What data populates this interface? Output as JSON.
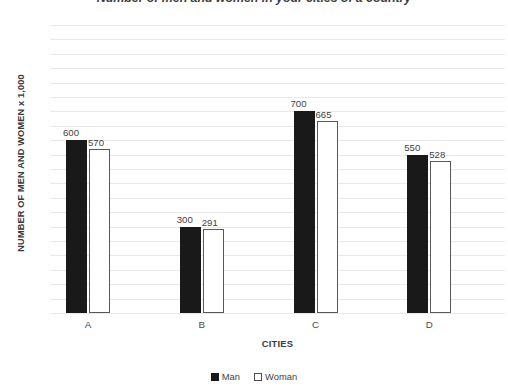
{
  "chart_data": {
    "type": "bar",
    "title": "Number of men and women in your cities of a country",
    "xlabel": "CITIES",
    "ylabel": "NUMBER OF MEN AND WOMEN x 1,000",
    "categories": [
      "A",
      "B",
      "C",
      "D"
    ],
    "series": [
      {
        "name": "Man",
        "color": "#191919",
        "values": [
          600,
          300,
          700,
          550
        ]
      },
      {
        "name": "Woman",
        "color": "#ffffff",
        "values": [
          570,
          291,
          665,
          528
        ]
      }
    ],
    "ylim": [
      0,
      1000
    ],
    "ytick_step": 50,
    "ytick_labels": [
      "1000",
      "950",
      "900",
      "850",
      "800",
      "750",
      "700",
      "650",
      "600",
      "550",
      "500",
      "450",
      "400",
      "350",
      "300",
      "250",
      "200",
      "150",
      "100",
      "50",
      "0"
    ],
    "grid": true,
    "legend_position": "bottom",
    "data_labels": {
      "man": [
        "600",
        "300",
        "700",
        "550"
      ],
      "woman": [
        "570",
        "291",
        "665",
        "528"
      ]
    }
  },
  "title_remnant": "'",
  "legend": {
    "items": [
      {
        "label": "Man"
      },
      {
        "label": "Woman"
      }
    ]
  }
}
